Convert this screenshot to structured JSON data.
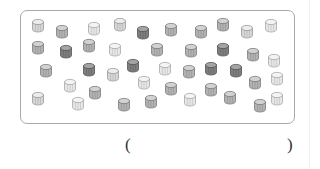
{
  "figure": {
    "shades": {
      "light": {
        "fill": "#e6e6e6",
        "top": "#f4f4f4",
        "stroke": "#a8a8a8"
      },
      "light-med": {
        "fill": "#d6d6d6",
        "top": "#ececec",
        "stroke": "#9a9a9a"
      },
      "medium": {
        "fill": "#b2b2b2",
        "top": "#d2d2d2",
        "stroke": "#7c7c7c"
      },
      "dark": {
        "fill": "#7e7e7e",
        "top": "#a4a4a4",
        "stroke": "#555555"
      }
    },
    "cylinders": [
      {
        "shade": "light-med"
      },
      {
        "shade": "medium"
      },
      {
        "shade": "light"
      },
      {
        "shade": "light-med"
      },
      {
        "shade": "dark"
      },
      {
        "shade": "medium"
      },
      {
        "shade": "medium"
      },
      {
        "shade": "medium"
      },
      {
        "shade": "light-med"
      },
      {
        "shade": "light"
      },
      {
        "shade": "medium"
      },
      {
        "shade": "dark"
      },
      {
        "shade": "medium"
      },
      {
        "shade": "light"
      },
      {
        "shade": "medium"
      },
      {
        "shade": "medium"
      },
      {
        "shade": "dark"
      },
      {
        "shade": "medium"
      },
      {
        "shade": "light"
      },
      {
        "shade": "medium"
      },
      {
        "shade": "dark"
      },
      {
        "shade": "light-med"
      },
      {
        "shade": "dark"
      },
      {
        "shade": "light"
      },
      {
        "shade": "medium"
      },
      {
        "shade": "dark"
      },
      {
        "shade": "dark"
      },
      {
        "shade": "medium"
      },
      {
        "shade": "light"
      },
      {
        "shade": "light"
      },
      {
        "shade": "medium"
      },
      {
        "shade": "light"
      },
      {
        "shade": "medium"
      },
      {
        "shade": "medium"
      },
      {
        "shade": "light-med"
      },
      {
        "shade": "light"
      },
      {
        "shade": "medium"
      },
      {
        "shade": "medium"
      },
      {
        "shade": "light"
      },
      {
        "shade": "medium"
      },
      {
        "shade": "medium"
      },
      {
        "shade": "light"
      }
    ]
  },
  "answer": {
    "open_paren": "(",
    "close_paren": ")",
    "value": ""
  }
}
